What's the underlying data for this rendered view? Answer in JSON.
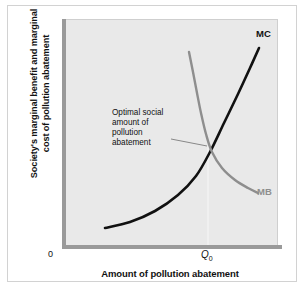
{
  "chart_data": {
    "type": "line",
    "title": "",
    "xlabel": "Amount of pollution abatement",
    "ylabel": "Society's marginal benefit and marginal cost of pollution abatement",
    "ylabel_line1": "Society's marginal benefit and marginal",
    "ylabel_line2": "cost of pollution abatement",
    "origin_label": "0",
    "xtick_labels": [
      "Q",
      "0"
    ],
    "xtick_label_display": "Q0",
    "grid": false,
    "legend_position": "inline-curve-end",
    "series": [
      {
        "name": "MC",
        "label": "MC",
        "color": "#111111",
        "description": "marginal cost of pollution abatement, upward sloping and convex",
        "points": [
          [
            105,
            228
          ],
          [
            130,
            222
          ],
          [
            155,
            211
          ],
          [
            178,
            195
          ],
          [
            196,
            176
          ],
          [
            210,
            152
          ],
          [
            224,
            123
          ],
          [
            238,
            94
          ],
          [
            250,
            68
          ],
          [
            259,
            48
          ]
        ]
      },
      {
        "name": "MB",
        "label": "MB",
        "color": "#8e8e8e",
        "description": "marginal benefit of pollution abatement, downward sloping and convex",
        "points": [
          [
            189,
            52
          ],
          [
            193,
            72
          ],
          [
            197,
            93
          ],
          [
            201,
            113
          ],
          [
            206,
            134
          ],
          [
            212,
            152
          ],
          [
            222,
            168
          ],
          [
            235,
            180
          ],
          [
            248,
            188
          ],
          [
            258,
            193
          ]
        ]
      }
    ],
    "annotations": [
      {
        "name": "optimal-social-amount",
        "lines": [
          "Optimal social",
          "amount of",
          "pollution",
          "abatement"
        ],
        "leader_from": [
          171,
          139
        ],
        "leader_to": [
          207,
          146
        ],
        "target_point": [
          208,
          146
        ]
      }
    ],
    "intersection": {
      "name": "equilibrium-point",
      "x": 208,
      "y": 146,
      "x_value_label": "Q0",
      "dropline_color": "#f2f2f2"
    },
    "axis": {
      "left_color": "#9a9a9a",
      "bottom_color": "#9a9a9a",
      "plot_background": "#e9e9e9"
    }
  }
}
